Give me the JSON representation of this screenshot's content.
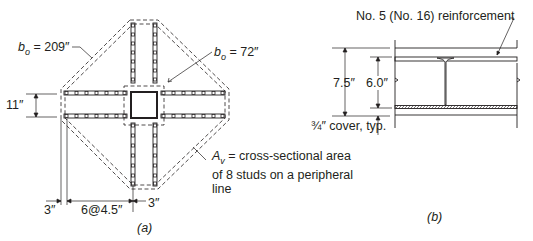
{
  "figure_a": {
    "caption": "(a)",
    "labels": {
      "bo_outer_sym": "b",
      "bo_outer_sub": "o",
      "bo_outer_val": " = 209″",
      "bo_inner_sym": "b",
      "bo_inner_sub": "o",
      "bo_inner_val": " = 72″",
      "rail_spacing": "11″",
      "av_sym": "A",
      "av_sub": "v",
      "av_line1": " = cross-sectional area",
      "av_line2": "of 8 studs on a peripheral",
      "av_line3": "line",
      "dim_left": "3″",
      "dim_studs": "6@4.5″",
      "dim_right": "3″"
    },
    "studs_per_rail": 8,
    "rails": 8
  },
  "figure_b": {
    "caption": "(b)",
    "labels": {
      "reinforcement": "No. 5 (No. 16) reinforcement",
      "slab_depth": "7.5″",
      "stud_height": "6.0″",
      "cover": "¾″ cover, typ."
    }
  }
}
